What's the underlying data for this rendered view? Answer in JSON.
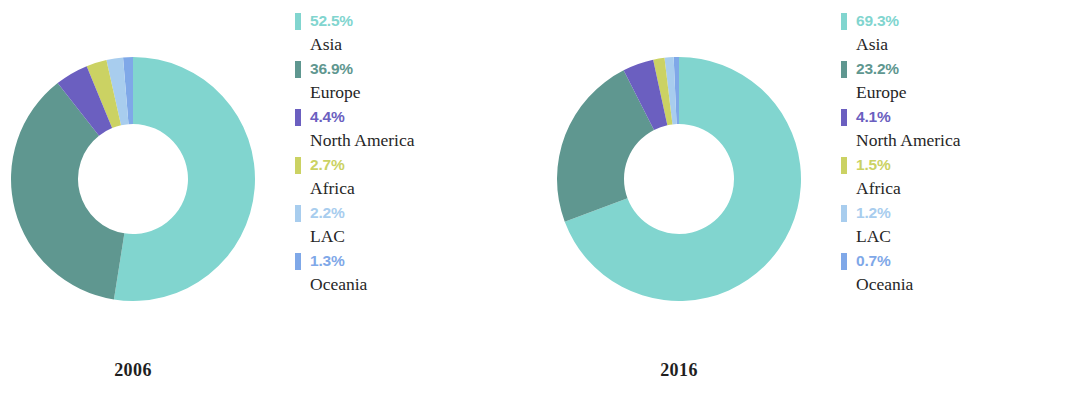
{
  "chart_data": {
    "type": "pie",
    "title": "",
    "subtitle": "",
    "variant": "donut",
    "layout": {
      "panels": 2,
      "legend_position": "right",
      "grid": false,
      "start_angle_deg": 0,
      "direction": "clockwise",
      "inner_radius_ratio": 0.45
    },
    "categories": [
      "Asia",
      "Europe",
      "North America",
      "Africa",
      "LAC",
      "Oceania"
    ],
    "colors": [
      "#81d5cf",
      "#5f9790",
      "#6b5fc0",
      "#cbd263",
      "#a8cdee",
      "#7fa8e8"
    ],
    "series": [
      {
        "name": "2006",
        "values": [
          52.5,
          36.9,
          4.4,
          2.7,
          2.2,
          1.3
        ]
      },
      {
        "name": "2016",
        "values": [
          69.3,
          23.2,
          4.1,
          1.5,
          1.2,
          0.7
        ]
      }
    ]
  },
  "palette": {
    "asia": "#81d5cf",
    "europe": "#5f9790",
    "north_america": "#6b5fc0",
    "africa": "#cbd263",
    "lac": "#a8cdee",
    "oceania": "#7fa8e8",
    "label_text": "#262626",
    "year_text": "#1f1f1f",
    "background": "#ffffff"
  },
  "panels": [
    {
      "year": "2006",
      "legend": [
        {
          "pct": "52.5%",
          "region": "Asia",
          "value": 52.5,
          "color": "#81d5cf",
          "swatch_icon": "legend-swatch-asia"
        },
        {
          "pct": "36.9%",
          "region": "Europe",
          "value": 36.9,
          "color": "#5f9790",
          "swatch_icon": "legend-swatch-europe"
        },
        {
          "pct": "4.4%",
          "region": "North America",
          "value": 4.4,
          "color": "#6b5fc0",
          "swatch_icon": "legend-swatch-north-america"
        },
        {
          "pct": "2.7%",
          "region": "Africa",
          "value": 2.7,
          "color": "#cbd263",
          "swatch_icon": "legend-swatch-africa"
        },
        {
          "pct": "2.2%",
          "region": "LAC",
          "value": 2.2,
          "color": "#a8cdee",
          "swatch_icon": "legend-swatch-lac"
        },
        {
          "pct": "1.3%",
          "region": "Oceania",
          "value": 1.3,
          "color": "#7fa8e8",
          "swatch_icon": "legend-swatch-oceania"
        }
      ]
    },
    {
      "year": "2016",
      "legend": [
        {
          "pct": "69.3%",
          "region": "Asia",
          "value": 69.3,
          "color": "#81d5cf",
          "swatch_icon": "legend-swatch-asia"
        },
        {
          "pct": "23.2%",
          "region": "Europe",
          "value": 23.2,
          "color": "#5f9790",
          "swatch_icon": "legend-swatch-europe"
        },
        {
          "pct": "4.1%",
          "region": "North America",
          "value": 4.1,
          "color": "#6b5fc0",
          "swatch_icon": "legend-swatch-north-america"
        },
        {
          "pct": "1.5%",
          "region": "Africa",
          "value": 1.5,
          "color": "#cbd263",
          "swatch_icon": "legend-swatch-africa"
        },
        {
          "pct": "1.2%",
          "region": "LAC",
          "value": 1.2,
          "color": "#a8cdee",
          "swatch_icon": "legend-swatch-lac"
        },
        {
          "pct": "0.7%",
          "region": "Oceania",
          "value": 0.7,
          "color": "#7fa8e8",
          "swatch_icon": "legend-swatch-oceania"
        }
      ]
    }
  ]
}
